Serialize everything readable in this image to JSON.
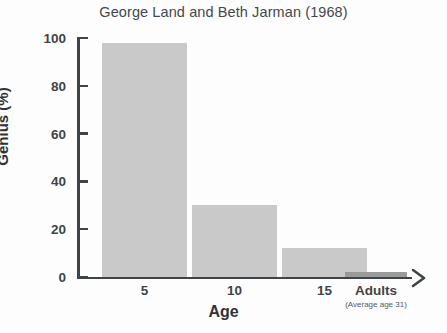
{
  "chart_data": {
    "type": "bar",
    "title": "George Land and Beth Jarman (1968)",
    "xlabel": "Age",
    "ylabel": "Genius (%)",
    "categories": [
      "5",
      "10",
      "15",
      "Adults"
    ],
    "category_sublabels": [
      "",
      "",
      "",
      "(Average age 31)"
    ],
    "values": [
      98,
      30,
      12,
      2
    ],
    "ylim": [
      0,
      100
    ],
    "yticks": [
      0,
      20,
      40,
      60,
      80,
      100
    ],
    "ytick_labels": [
      "0",
      "20",
      "40",
      "60",
      "80",
      "100"
    ],
    "grid": false,
    "legend": "none",
    "bar_colors": [
      "#c9c9c9",
      "#c9c9c9",
      "#c9c9c9",
      "#9a9a9a"
    ],
    "axis_color": "#3f4447",
    "title_color": "#44484c"
  }
}
